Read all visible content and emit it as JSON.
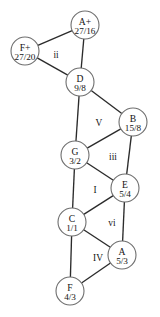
{
  "diagram": {
    "width": 160,
    "height": 317,
    "node_radius": 14,
    "stroke_color": "#2b2b2b",
    "node_fill": "#ffffff",
    "node_stroke": "#6e6e6e",
    "text_color": "#141414",
    "nodes": [
      {
        "id": "Aplus",
        "name": "A+",
        "ratio": "27/16",
        "cx": 85,
        "cy": 25
      },
      {
        "id": "Fplus",
        "name": "F+",
        "ratio": "27/20",
        "cx": 25,
        "cy": 51
      },
      {
        "id": "D",
        "name": "D",
        "ratio": "9/8",
        "cx": 80,
        "cy": 82
      },
      {
        "id": "B",
        "name": "B",
        "ratio": "15/8",
        "cx": 133,
        "cy": 122
      },
      {
        "id": "G",
        "name": "G",
        "ratio": "3/2",
        "cx": 75,
        "cy": 155
      },
      {
        "id": "E",
        "name": "E",
        "ratio": "5/4",
        "cx": 125,
        "cy": 188
      },
      {
        "id": "C",
        "name": "C",
        "ratio": "1/1",
        "cx": 72,
        "cy": 222
      },
      {
        "id": "A",
        "name": "A",
        "ratio": "5/3",
        "cx": 122,
        "cy": 255
      },
      {
        "id": "F",
        "name": "F",
        "ratio": "4/3",
        "cx": 70,
        "cy": 291
      }
    ],
    "edges": [
      {
        "from": "Fplus",
        "to": "Aplus"
      },
      {
        "from": "Fplus",
        "to": "D"
      },
      {
        "from": "Aplus",
        "to": "D"
      },
      {
        "from": "D",
        "to": "B"
      },
      {
        "from": "D",
        "to": "G"
      },
      {
        "from": "G",
        "to": "B"
      },
      {
        "from": "G",
        "to": "E"
      },
      {
        "from": "B",
        "to": "E"
      },
      {
        "from": "G",
        "to": "C"
      },
      {
        "from": "C",
        "to": "E"
      },
      {
        "from": "C",
        "to": "A"
      },
      {
        "from": "E",
        "to": "A"
      },
      {
        "from": "C",
        "to": "F"
      },
      {
        "from": "F",
        "to": "A"
      }
    ],
    "region_labels": [
      {
        "id": "region-ii",
        "text": "ii",
        "x": 56,
        "y": 58
      },
      {
        "id": "region-V",
        "text": "V",
        "x": 99,
        "y": 126
      },
      {
        "id": "region-iii",
        "text": "iii",
        "x": 113,
        "y": 160
      },
      {
        "id": "region-I",
        "text": "I",
        "x": 95,
        "y": 193
      },
      {
        "id": "region-vi",
        "text": "vi",
        "x": 112,
        "y": 226
      },
      {
        "id": "region-IV",
        "text": "IV",
        "x": 98,
        "y": 261
      }
    ]
  }
}
